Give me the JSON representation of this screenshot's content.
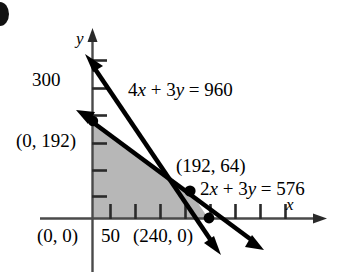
{
  "figure": {
    "kind": "linear-programming-feasible-region",
    "axes": {
      "x_axis_label": "x",
      "y_axis_label": "y",
      "x_tick_label": "50",
      "y_tick_label": "300"
    },
    "labels": {
      "origin": "(0, 0)",
      "y_intercept": "(0, 192)",
      "x_intercept": "(240, 0)",
      "intersection": "(192, 64)",
      "line1_equation": "4x + 3y = 960",
      "line2_equation": "2x + 3y = 576"
    },
    "colors": {
      "shaded_region": "#b7b7b7",
      "line": "#000000",
      "axis": "#4a4a4a",
      "background": "#ffffff"
    }
  },
  "chart_data": {
    "type": "line",
    "title": "",
    "xlabel": "x",
    "ylabel": "y",
    "xlim": [
      0,
      400
    ],
    "ylim": [
      0,
      360
    ],
    "grid": false,
    "legend": "none",
    "x_ticks": [
      50,
      100,
      150,
      200,
      250,
      300,
      350
    ],
    "x_tick_labels_shown": [
      "50"
    ],
    "y_ticks": [
      50,
      100,
      150,
      200,
      250,
      300
    ],
    "y_tick_labels_shown": [
      "300"
    ],
    "series": [
      {
        "name": "4x + 3y = 960",
        "equation": "4x + 3y = 960",
        "x_intercept": 240,
        "y_intercept": 320,
        "slope": -1.3333,
        "arrows": "both"
      },
      {
        "name": "2x + 3y = 576",
        "equation": "2x + 3y = 576",
        "x_intercept": 288,
        "y_intercept": 192,
        "slope": -0.6667,
        "arrows": "both"
      }
    ],
    "points": [
      {
        "label": "(0, 0)",
        "x": 0,
        "y": 0,
        "marked": false
      },
      {
        "label": "(0, 192)",
        "x": 0,
        "y": 192,
        "marked": true
      },
      {
        "label": "(192, 64)",
        "x": 192,
        "y": 64,
        "marked": true
      },
      {
        "label": "(240, 0)",
        "x": 240,
        "y": 0,
        "marked": true
      }
    ],
    "shaded_region": {
      "description": "feasible region bounded by axes and both lines",
      "vertices": [
        [
          0,
          0
        ],
        [
          0,
          192
        ],
        [
          192,
          64
        ],
        [
          240,
          0
        ]
      ],
      "color": "#b7b7b7"
    },
    "annotations": [
      {
        "text": "4x + 3y = 960",
        "x": 150,
        "y": 280
      },
      {
        "text": "2x + 3y = 576",
        "x": 300,
        "y": 60
      }
    ]
  }
}
